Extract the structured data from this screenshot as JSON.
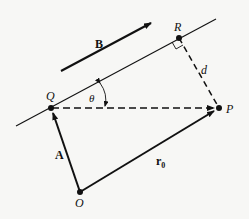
{
  "diagram": {
    "type": "vector geometry: distance from point P to line through Q in direction B",
    "points": {
      "Q": {
        "label": "Q",
        "x": 51,
        "y": 108
      },
      "R": {
        "label": "R",
        "x": 179,
        "y": 38
      },
      "P": {
        "label": "P",
        "x": 219,
        "y": 108
      },
      "O": {
        "label": "O",
        "x": 80,
        "y": 192
      }
    },
    "labels": {
      "B": "B",
      "A": "A",
      "r0": "r",
      "r0_sub": "0",
      "d": "d",
      "theta": "θ",
      "Q": "Q",
      "R": "R",
      "P": "P",
      "O": "O"
    },
    "edges": [
      {
        "from": "O",
        "to": "Q",
        "label": "A",
        "style": "solid-arrow"
      },
      {
        "from": "O",
        "to": "P",
        "label": "r0",
        "style": "solid-arrow"
      },
      {
        "from": "Q",
        "to": "P",
        "style": "dashed-arrow"
      },
      {
        "from": "R",
        "to": "P",
        "label": "d",
        "style": "dashed"
      },
      {
        "line": "through Q and R",
        "style": "solid"
      },
      {
        "vector": "B",
        "style": "solid-arrow",
        "direction": "parallel to line"
      }
    ],
    "annotations": [
      "right-angle marker at R",
      "angle θ between line and QP"
    ],
    "colors": {
      "ink": "#111111",
      "background": "#f7f7f5"
    }
  }
}
